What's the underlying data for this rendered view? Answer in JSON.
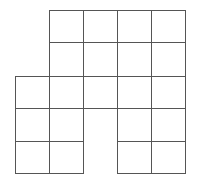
{
  "diagram": {
    "type": "grid-net",
    "stroke_color": "#555555",
    "background": "#ffffff",
    "cell_size": 34,
    "col_edges": [
      15,
      49,
      83,
      117,
      151,
      185
    ],
    "row_edges": [
      10,
      42,
      76,
      108,
      141,
      173
    ],
    "cells": [
      [
        1,
        0
      ],
      [
        2,
        0
      ],
      [
        3,
        0
      ],
      [
        4,
        0
      ],
      [
        1,
        1
      ],
      [
        2,
        1
      ],
      [
        3,
        1
      ],
      [
        4,
        1
      ],
      [
        0,
        2
      ],
      [
        1,
        2
      ],
      [
        2,
        2
      ],
      [
        3,
        2
      ],
      [
        4,
        2
      ],
      [
        0,
        3
      ],
      [
        1,
        3
      ],
      [
        3,
        3
      ],
      [
        4,
        3
      ],
      [
        0,
        4
      ],
      [
        1,
        4
      ],
      [
        3,
        4
      ],
      [
        4,
        4
      ]
    ],
    "cell_count": 21
  }
}
